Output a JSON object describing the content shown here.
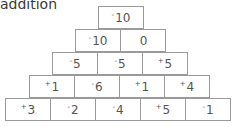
{
  "title": "addition",
  "pyramid": {
    "rows": [
      [
        {
          "sign": "-",
          "value": "10"
        }
      ],
      [
        {
          "sign": "-",
          "value": "10"
        },
        {
          "sign": "",
          "value": "0"
        }
      ],
      [
        {
          "sign": "-",
          "value": "5"
        },
        {
          "sign": "-",
          "value": "5"
        },
        {
          "sign": "+",
          "value": "5"
        }
      ],
      [
        {
          "sign": "+",
          "value": "1"
        },
        {
          "sign": "-",
          "value": "6"
        },
        {
          "sign": "+",
          "value": "1"
        },
        {
          "sign": "+",
          "value": "4"
        }
      ],
      [
        {
          "sign": "+",
          "value": "3"
        },
        {
          "sign": "-",
          "value": "2"
        },
        {
          "sign": "-",
          "value": "4"
        },
        {
          "sign": "+",
          "value": "5"
        },
        {
          "sign": "-",
          "value": "1"
        }
      ]
    ]
  }
}
